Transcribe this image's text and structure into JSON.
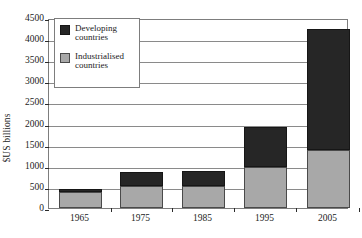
{
  "chart_data": {
    "type": "bar",
    "subtype": "stacked-vertical",
    "title": "",
    "subtitle": "",
    "xlabel": "",
    "ylabel": "$US billions",
    "categories": [
      "1965",
      "1975",
      "1985",
      "1995",
      "2005"
    ],
    "series": [
      {
        "name": "Industrialised countries",
        "color": "#a8a8a8",
        "values": [
          380,
          530,
          530,
          960,
          1380
        ]
      },
      {
        "name": "Developing countries",
        "color": "#262626",
        "values": [
          70,
          320,
          340,
          960,
          2870
        ]
      }
    ],
    "totals": [
      450,
      850,
      870,
      1920,
      4250
    ],
    "ylim": [
      0,
      4500
    ],
    "ytick_step": 500,
    "yticks": [
      "0",
      "500",
      "1000",
      "1500",
      "2000",
      "2500",
      "3000",
      "3500",
      "4000",
      "4500"
    ],
    "grid": true,
    "grid_axis": "y",
    "legend_position": "top-left",
    "legend_entries": [
      {
        "label_line1": "Developing",
        "label_line2": "countries",
        "color": "#262626"
      },
      {
        "label_line1": "Industrialised",
        "label_line2": "countries",
        "color": "#a8a8a8"
      }
    ],
    "stack_order": [
      "Industrialised countries",
      "Developing countries"
    ]
  },
  "axes": {
    "y_title": "$US billions"
  }
}
